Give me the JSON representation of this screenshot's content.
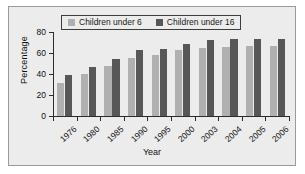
{
  "chart_data": {
    "type": "bar",
    "title": "",
    "xlabel": "Year",
    "ylabel": "Percentage",
    "categories": [
      "1976",
      "1980",
      "1985",
      "1990",
      "1995",
      "2000",
      "2003",
      "2004",
      "2005",
      "2006"
    ],
    "series": [
      {
        "name": "Children under 6",
        "color": "#b0b0b0",
        "values": [
          31,
          40,
          48,
          55,
          58,
          63,
          65,
          66,
          67,
          67
        ]
      },
      {
        "name": "Children under 16",
        "color": "#575757",
        "values": [
          39,
          47,
          54,
          63,
          64,
          69,
          72,
          73,
          73,
          73
        ]
      }
    ],
    "ylim": [
      0,
      80
    ],
    "yticks": [
      0,
      20,
      40,
      60,
      80
    ],
    "ytick_labels": [
      "0",
      "20",
      "40",
      "60",
      "80"
    ],
    "grid": false,
    "legend_position": "top-center",
    "background_color": "#ececec",
    "axis_color": "#2b2b2b"
  }
}
